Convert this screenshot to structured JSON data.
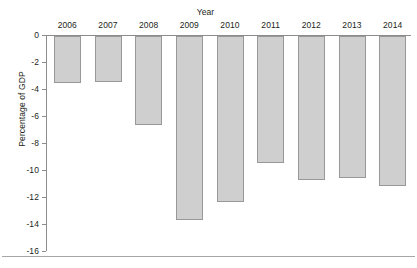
{
  "chart_data": {
    "type": "bar",
    "title": "",
    "xlabel": "Year",
    "ylabel": "Percentage of GDP",
    "categories": [
      "2006",
      "2007",
      "2008",
      "2009",
      "2010",
      "2011",
      "2012",
      "2013",
      "2014"
    ],
    "values": [
      -3.5,
      -3.4,
      -6.6,
      -13.6,
      -12.3,
      -9.4,
      -10.7,
      -10.5,
      -11.1
    ],
    "ylim": [
      -16,
      0
    ],
    "ytick_labels": [
      "0",
      "-2",
      "-4",
      "-6",
      "-8",
      "-10",
      "-12",
      "-14",
      "-16"
    ],
    "ytick_values": [
      0,
      -2,
      -4,
      -6,
      -8,
      -10,
      -12,
      -14,
      -16
    ],
    "grid": false,
    "legend": "none",
    "bar_color": "#cfcfcf",
    "bar_edge_color": "#989898",
    "axis_color": "#8c8c8c",
    "text_color": "#231f20"
  }
}
